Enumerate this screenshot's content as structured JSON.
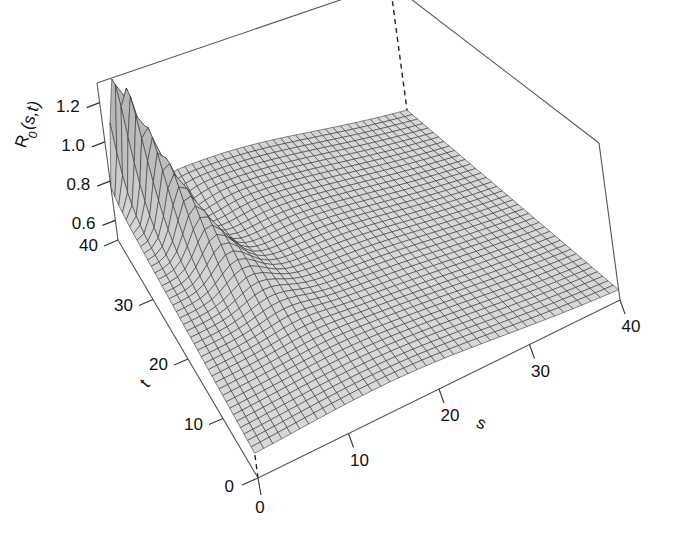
{
  "figure": {
    "type": "surface-3d",
    "background": "#ffffff",
    "width": 686,
    "height": 547
  },
  "chart_data": {
    "type": "surface",
    "title": "",
    "xlabel": "s",
    "ylabel": "t",
    "zlabel": "R0(s,t)",
    "zlabel_base": "R",
    "zlabel_sub": "0",
    "zlabel_rest": "(s,t)",
    "x": [
      0,
      40
    ],
    "y": [
      0,
      40
    ],
    "xlim": [
      0,
      40
    ],
    "ylim": [
      0,
      40
    ],
    "zlim": [
      0.5,
      1.3
    ],
    "xticks": [
      0,
      10,
      20,
      30,
      40
    ],
    "yticks": [
      0,
      10,
      20,
      30,
      40
    ],
    "zticks": [
      0.6,
      0.8,
      1.0,
      1.2
    ],
    "xtick_labels": [
      "0",
      "10",
      "20",
      "30",
      "40"
    ],
    "ytick_labels": [
      "0",
      "10",
      "20",
      "30",
      "40"
    ],
    "ztick_labels": [
      "0.6",
      "0.8",
      "1.0",
      "1.2"
    ],
    "grid": true,
    "legend": "none",
    "mesh_n_s": 41,
    "mesh_n_t": 41,
    "surface_fill": "#c8c8c8",
    "surface_line": "#2b2b2b",
    "box_line": "#4a4a4a",
    "z_samples": {
      "note": "Representative R0 values read off the z-axis for key (s,t) locations.",
      "points": [
        {
          "s": 0,
          "t": 0,
          "z": 0.62
        },
        {
          "s": 40,
          "t": 0,
          "z": 0.58
        },
        {
          "s": 0,
          "t": 40,
          "z": 0.7
        },
        {
          "s": 40,
          "t": 40,
          "z": 0.6
        },
        {
          "s": 20,
          "t": 20,
          "z": 0.8
        },
        {
          "s": 5,
          "t": 38,
          "z": 1.25
        },
        {
          "s": 10,
          "t": 30,
          "z": 1.02
        },
        {
          "s": 15,
          "t": 25,
          "z": 0.88
        },
        {
          "s": 30,
          "t": 10,
          "z": 0.66
        },
        {
          "s": 8,
          "t": 8,
          "z": 0.7
        }
      ]
    }
  },
  "axes": {
    "z_axis": {
      "name": "R0(s,t)",
      "ticks": [
        {
          "label": "1.2",
          "value": 1.2
        },
        {
          "label": "1.0",
          "value": 1.0
        },
        {
          "label": "0.8",
          "value": 0.8
        },
        {
          "label": "0.6",
          "value": 0.6
        }
      ]
    },
    "t_axis": {
      "name": "t",
      "ticks": [
        {
          "label": "40",
          "value": 40
        },
        {
          "label": "30",
          "value": 30
        },
        {
          "label": "20",
          "value": 20
        },
        {
          "label": "10",
          "value": 10
        },
        {
          "label": "0",
          "value": 0
        }
      ]
    },
    "s_axis": {
      "name": "s",
      "ticks": [
        {
          "label": "0",
          "value": 0
        },
        {
          "label": "10",
          "value": 10
        },
        {
          "label": "20",
          "value": 20
        },
        {
          "label": "30",
          "value": 30
        },
        {
          "label": "40",
          "value": 40
        }
      ]
    }
  }
}
